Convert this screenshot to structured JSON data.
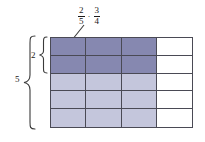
{
  "figure": {
    "type": "area-model-fraction-multiplication",
    "background_color": "#ffffff",
    "expression": {
      "left_fraction": {
        "numerator": "2",
        "denominator": "5"
      },
      "operator": "·",
      "right_fraction": {
        "numerator": "3",
        "denominator": "4"
      },
      "full_text": "2/5 · 3/4"
    },
    "grid": {
      "columns": 4,
      "rows": 5,
      "shaded_columns": 3,
      "shaded_rows": 2,
      "line_color": "#4a4a55",
      "light_fill_color": "#c4c6dc",
      "dark_fill_color": "#8688b0",
      "empty_fill_color": "#ffffff",
      "cells": [
        [
          "dark",
          "dark",
          "dark",
          "empty"
        ],
        [
          "dark",
          "dark",
          "dark",
          "empty"
        ],
        [
          "light",
          "light",
          "light",
          "empty"
        ],
        [
          "light",
          "light",
          "light",
          "empty"
        ],
        [
          "light",
          "light",
          "light",
          "empty"
        ]
      ]
    },
    "braces": {
      "outer": {
        "label": "5",
        "spans_rows": 5
      },
      "inner": {
        "label": "2",
        "spans_rows": 2
      }
    },
    "leader_line": {
      "from": "expression",
      "to": "top-left-dark-cell",
      "color": "#3a3a3a"
    }
  }
}
